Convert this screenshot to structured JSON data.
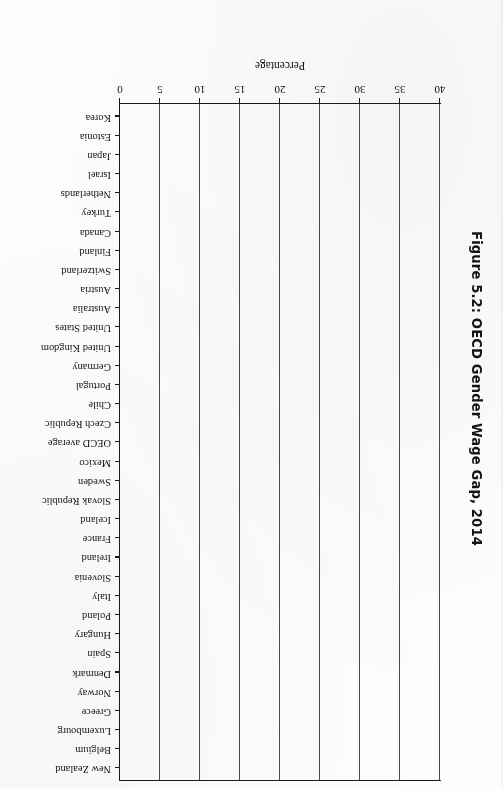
{
  "figure": {
    "title": "Figure 5.2: OECD Gender Wage Gap, 2014",
    "page_orientation": "rotated-180",
    "colors": {
      "bar": "#141414",
      "axis": "#1a1a1a",
      "grid": "#4a4a4a",
      "page": "#fdfdfc"
    }
  },
  "chart_data": {
    "type": "bar",
    "orientation": "horizontal",
    "title": "Figure 5.2: OECD Gender Wage Gap, 2014",
    "xlabel": "Percentage",
    "ylabel": "",
    "xlim": [
      0,
      40
    ],
    "xticks": [
      0,
      5,
      10,
      15,
      20,
      25,
      30,
      35,
      40
    ],
    "xtick_labels": [
      "0",
      "5",
      "10",
      "15",
      "20",
      "25",
      "30",
      "35",
      "40"
    ],
    "grid": true,
    "legend": null,
    "categories": [
      "Korea",
      "Estonia",
      "Japan",
      "Israel",
      "Netherlands",
      "Turkey",
      "Canada",
      "Finland",
      "Switzerland",
      "Austria",
      "Australia",
      "United States",
      "United Kingdom",
      "Germany",
      "Portugal",
      "Chile",
      "Czech Republic",
      "OECD average",
      "Mexico",
      "Sweden",
      "Slovak Republic",
      "Iceland",
      "France",
      "Ireland",
      "Slovenia",
      "Italy",
      "Poland",
      "Hungary",
      "Spain",
      "Denmark",
      "Norway",
      "Greece",
      "Luxembourg",
      "Belgium",
      "New Zealand"
    ],
    "values": [
      36.7,
      31.5,
      26.6,
      21.8,
      20.5,
      20.1,
      19.2,
      18.6,
      18.1,
      18.0,
      17.5,
      17.5,
      17.4,
      17.1,
      16.9,
      16.1,
      15.1,
      15.0,
      14.7,
      14.1,
      13.9,
      13.6,
      13.4,
      12.9,
      12.1,
      11.1,
      10.6,
      8.7,
      8.6,
      7.0,
      6.3,
      6.1,
      5.4,
      5.1,
      4.6
    ]
  },
  "axis": {
    "x_title": "Percentage"
  }
}
